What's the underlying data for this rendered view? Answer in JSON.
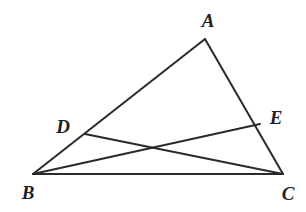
{
  "figure": {
    "kind": "geometry-diagram",
    "background_color": "#ffffff",
    "stroke_color": "#2a2a2a",
    "stroke_width": 2,
    "width": 306,
    "height": 212
  },
  "points": {
    "A": {
      "label": "A",
      "x": 205,
      "y": 39,
      "label_x": 208,
      "label_y": 20
    },
    "B": {
      "label": "B",
      "x": 33,
      "y": 174,
      "label_x": 28,
      "label_y": 192
    },
    "C": {
      "label": "C",
      "x": 283,
      "y": 174,
      "label_x": 288,
      "label_y": 193
    },
    "D": {
      "label": "D",
      "x": 85,
      "y": 134,
      "label_x": 63,
      "label_y": 126
    },
    "E": {
      "label": "E",
      "x": 260,
      "y": 124,
      "label_x": 276,
      "label_y": 117
    }
  },
  "segments": [
    {
      "name": "side-AB",
      "from": "A",
      "to": "B"
    },
    {
      "name": "side-AC",
      "from": "A",
      "to": "C"
    },
    {
      "name": "side-BC",
      "from": "B",
      "to": "C"
    },
    {
      "name": "cevian-DC",
      "from": "D",
      "to": "C"
    },
    {
      "name": "cevian-BE",
      "from": "B",
      "to": "E"
    }
  ]
}
